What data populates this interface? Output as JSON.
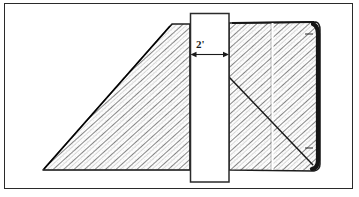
{
  "figure": {
    "frame": {
      "border_color": "#2a2a2a",
      "background_color": "#ffffff"
    },
    "dimension": {
      "label": "2'",
      "value": 2,
      "unit": "feet",
      "arrow_style": "double-headed",
      "orientation": "horizontal",
      "measures": "width of vertical column"
    },
    "shapes": [
      {
        "name": "left-embankment-triangle",
        "type": "triangle",
        "fill": "hatched",
        "hatch_direction": "up-right",
        "hatch_color": "#7a7a7a",
        "outline_color": "#1a1a1a",
        "vertices": [
          [
            43,
            170
          ],
          [
            173,
            24
          ],
          [
            190,
            24
          ],
          [
            190,
            170
          ]
        ]
      },
      {
        "name": "right-fill-rectangle",
        "type": "rectangle",
        "fill": "hatched",
        "hatch_direction": "up-right",
        "hatch_color": "#7a7a7a",
        "outline_color": "#1a1a1a",
        "bounds": [
          229,
          22,
          320,
          171
        ]
      }
    ],
    "annotations": [
      {
        "name": "vertical-column",
        "type": "rectangle-outline",
        "fill": "#ffffff",
        "stroke": "#2a2a2a",
        "bounds": [
          190,
          13,
          229,
          182
        ]
      },
      {
        "name": "interior-vertical-joint-line",
        "type": "line",
        "stroke": "#ffffff",
        "points": [
          [
            272,
            23
          ],
          [
            272,
            170
          ]
        ]
      },
      {
        "name": "failure-plane-diagonal",
        "type": "line",
        "stroke": "#1a1a1a",
        "points": [
          [
            229,
            77
          ],
          [
            313,
            165
          ]
        ]
      },
      {
        "name": "thick-right-edge",
        "type": "line",
        "stroke": "#141414",
        "points": [
          [
            318,
            24
          ],
          [
            318,
            169
          ]
        ]
      }
    ],
    "caption_fragment": ""
  },
  "colors": {
    "ink": "#1a1a1a",
    "frame": "#2a2a2a",
    "hatch": "#7a7a7a",
    "paper": "#ffffff"
  }
}
